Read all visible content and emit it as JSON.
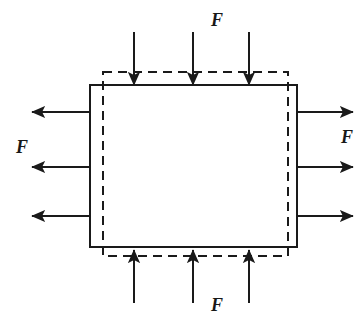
{
  "figure": {
    "background_color": "#ffffff",
    "line_color": "#1a1a1a"
  },
  "labels": {
    "top": "F",
    "bottom": "F",
    "left": "F",
    "right": "F"
  },
  "shapes": {
    "solid_rect": {
      "name": "solid-body-outline",
      "x": 90,
      "y": 85,
      "width": 207,
      "height": 162,
      "stroke": "#1a1a1a",
      "stroke_width": 2,
      "fill": "none",
      "dashed": false
    },
    "dashed_rect": {
      "name": "dashed-reference-outline",
      "x": 103,
      "y": 72,
      "width": 185,
      "height": 184,
      "stroke": "#1a1a1a",
      "stroke_width": 2,
      "fill": "none",
      "dashed": true,
      "dash_pattern": "9 6"
    }
  },
  "arrows": {
    "top": {
      "direction": "down",
      "count": 3,
      "x_positions": [
        134,
        193,
        249
      ],
      "start_y": 32,
      "end_y": 85
    },
    "bottom": {
      "direction": "up",
      "count": 3,
      "x_positions": [
        134,
        193,
        249
      ],
      "start_y": 303,
      "end_y": 250
    },
    "left": {
      "direction": "left",
      "count": 3,
      "y_positions": [
        112,
        167,
        216
      ],
      "start_x": 90,
      "end_x": 32
    },
    "right": {
      "direction": "right",
      "count": 3,
      "y_positions": [
        112,
        167,
        216
      ],
      "start_x": 297,
      "end_x": 353
    }
  }
}
